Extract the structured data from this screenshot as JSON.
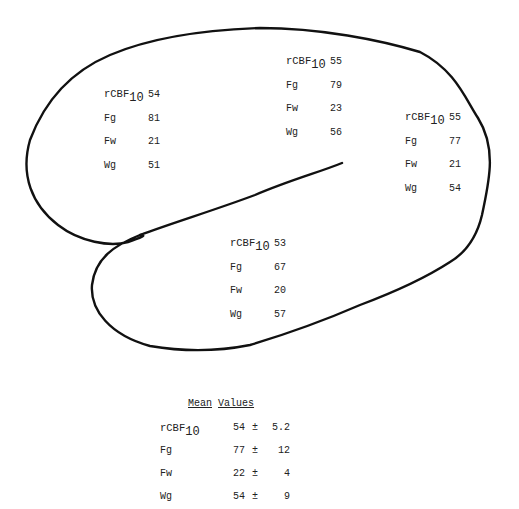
{
  "regions": [
    {
      "name": "frontal",
      "rows": [
        {
          "label": "rCBF",
          "sub": "10",
          "value": "54"
        },
        {
          "label": "Fg",
          "value": "81"
        },
        {
          "label": "Fw",
          "value": "21"
        },
        {
          "label": "Wg",
          "value": "51"
        }
      ]
    },
    {
      "name": "parietal",
      "rows": [
        {
          "label": "rCBF",
          "sub": "10",
          "value": "55"
        },
        {
          "label": "Fg",
          "value": "79"
        },
        {
          "label": "Fw",
          "value": "23"
        },
        {
          "label": "Wg",
          "value": "56"
        }
      ]
    },
    {
      "name": "occipital",
      "rows": [
        {
          "label": "rCBF",
          "sub": "10",
          "value": "55"
        },
        {
          "label": "Fg",
          "value": "77"
        },
        {
          "label": "Fw",
          "value": "21"
        },
        {
          "label": "Wg",
          "value": "54"
        }
      ]
    },
    {
      "name": "temporal",
      "rows": [
        {
          "label": "rCBF",
          "sub": "10",
          "value": "53"
        },
        {
          "label": "Fg",
          "value": "67"
        },
        {
          "label": "Fw",
          "value": "20"
        },
        {
          "label": "Wg",
          "value": "57"
        }
      ]
    }
  ],
  "mean": {
    "title_word1": "Mean",
    "title_word2": "Values",
    "rows": [
      {
        "label": "rCBF",
        "sub": "10",
        "mean": "54",
        "pm": "±",
        "sd": "5.2"
      },
      {
        "label": "Fg",
        "mean": "77",
        "pm": "±",
        "sd": "12"
      },
      {
        "label": "Fw",
        "mean": "22",
        "pm": "±",
        "sd": "4"
      },
      {
        "label": "Wg",
        "mean": "54",
        "pm": "±",
        "sd": "9"
      }
    ]
  },
  "colors": {
    "outline": "#111111",
    "text": "#222222",
    "background": "#ffffff"
  }
}
